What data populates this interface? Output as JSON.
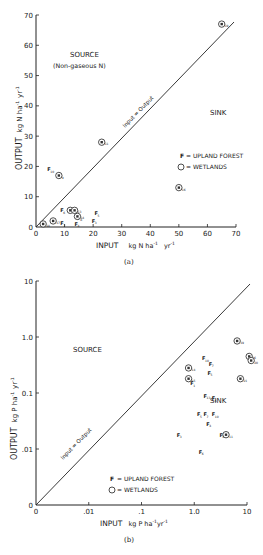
{
  "chart_data": [
    {
      "id": "a",
      "type": "scatter",
      "caption": "(a)",
      "xlabel": "INPUT  kg N ha⁻¹ yr⁻¹",
      "xlabel_parts": {
        "main": "INPUT",
        "unit": "kg N ha",
        "exp1": "-1",
        "yr": "yr",
        "exp2": "-1"
      },
      "ylabel": "OUTPUT  kg N ha⁻¹ yr⁻¹",
      "ylabel_parts": {
        "main": "OUTPUT",
        "unit": "kg N ha",
        "exp1": "-1",
        "yr": "yr",
        "exp2": "-1"
      },
      "xlim": [
        0,
        70
      ],
      "ylim": [
        0,
        70
      ],
      "xticks": [
        "0",
        "10",
        "20",
        "30",
        "40",
        "50",
        "60",
        "70"
      ],
      "yticks": [
        "0",
        "10",
        "20",
        "30",
        "40",
        "50",
        "60",
        "70"
      ],
      "annotations": {
        "source": "SOURCE",
        "source_sub": "(Non-gaseous N)",
        "sink": "SINK",
        "line": "Input = Output"
      },
      "legend": [
        {
          "marker": "F",
          "label": "= UPLAND FOREST"
        },
        {
          "marker": "W",
          "label": "= WETLANDS"
        }
      ],
      "series": [
        {
          "name": "Upland forest",
          "points": [
            {
              "x": 4.5,
              "y": 19,
              "label": "10"
            },
            {
              "x": 9,
              "y": 5.5,
              "label": "6"
            },
            {
              "x": 9,
              "y": 1.2,
              "label": "7"
            },
            {
              "x": 14,
              "y": 1,
              "label": "4"
            },
            {
              "x": 20,
              "y": 2,
              "label": "3"
            },
            {
              "x": 21,
              "y": 4.5,
              "label": "5"
            },
            {
              "x": 2,
              "y": 1,
              "label": "1"
            },
            {
              "x": 15,
              "y": 3,
              "label": "8"
            }
          ]
        },
        {
          "name": "Wetlands",
          "points": [
            {
              "x": 65,
              "y": 67,
              "label": "19"
            },
            {
              "x": 23,
              "y": 28,
              "label": "11"
            },
            {
              "x": 8,
              "y": 17,
              "label": "9"
            },
            {
              "x": 50,
              "y": 13,
              "label": "16"
            },
            {
              "x": 12,
              "y": 5.5,
              "label": "12"
            },
            {
              "x": 13.5,
              "y": 5.5,
              "label": "13"
            },
            {
              "x": 14.5,
              "y": 3.5,
              "label": "14"
            },
            {
              "x": 6,
              "y": 2,
              "label": "17"
            },
            {
              "x": 2.5,
              "y": 1,
              "label": "18"
            }
          ]
        }
      ]
    },
    {
      "id": "b",
      "type": "scatter",
      "caption": "(b)",
      "xlabel": "INPUT  kg P ha⁻¹ yr⁻¹",
      "xlabel_parts": {
        "main": "INPUT",
        "unit": "kg P ha",
        "exp1": "-1",
        "yr": "yr",
        "exp2": "-1"
      },
      "ylabel": "OUTPUT  kg P ha⁻¹ yr⁻¹",
      "ylabel_parts": {
        "main": "OUTPUT",
        "unit": "kg P ha",
        "exp1": "-1",
        "yr": "yr",
        "exp2": "-1"
      },
      "scale": "log",
      "xticks": [
        "0",
        ".01",
        ".1",
        "1.0",
        "10"
      ],
      "yticks": [
        "0",
        ".01",
        "0.1",
        "1.0",
        "10"
      ],
      "annotations": {
        "source": "SOURCE",
        "sink": "SINK",
        "line": "Input = Output"
      },
      "legend": [
        {
          "marker": "F",
          "label": "= UPLAND FOREST"
        },
        {
          "marker": "W",
          "label": "= WETLANDS"
        }
      ],
      "series": [
        {
          "name": "Upland forest",
          "points": [
            {
              "x": 0.9,
              "y": 0.15,
              "label": "1"
            },
            {
              "x": 1.5,
              "y": 0.42,
              "label": "10"
            },
            {
              "x": 2.0,
              "y": 0.33,
              "label": "7"
            },
            {
              "x": 1.9,
              "y": 0.23,
              "label": "5"
            },
            {
              "x": 1.6,
              "y": 0.09,
              "label": "13"
            },
            {
              "x": 2.3,
              "y": 0.08,
              "label": "6"
            },
            {
              "x": 1.2,
              "y": 0.042,
              "label": "5"
            },
            {
              "x": 1.6,
              "y": 0.042,
              "label": "7"
            },
            {
              "x": 2.3,
              "y": 0.042,
              "label": "10"
            },
            {
              "x": 1.8,
              "y": 0.028,
              "label": "4"
            },
            {
              "x": 0.5,
              "y": 0.018,
              "label": "3"
            },
            {
              "x": 1.3,
              "y": 0.009,
              "label": "6"
            },
            {
              "x": 3.2,
              "y": 0.018,
              "label": "8"
            }
          ]
        },
        {
          "name": "Wetlands",
          "points": [
            {
              "x": 45,
              "y": 5.0,
              "label": "17"
            },
            {
              "x": 55,
              "y": 3.8,
              "label": "22"
            },
            {
              "x": 45,
              "y": 3.2,
              "label": "18"
            },
            {
              "x": 6.5,
              "y": 0.85,
              "label": "19"
            },
            {
              "x": 11,
              "y": 0.45,
              "label": "16"
            },
            {
              "x": 12,
              "y": 0.38,
              "label": "20"
            },
            {
              "x": 0.78,
              "y": 0.28,
              "label": "14"
            },
            {
              "x": 0.78,
              "y": 0.18,
              "label": "15"
            },
            {
              "x": 7.5,
              "y": 0.18,
              "label": "21"
            },
            {
              "x": 4.0,
              "y": 0.018,
              "label": "11"
            }
          ]
        }
      ]
    }
  ]
}
